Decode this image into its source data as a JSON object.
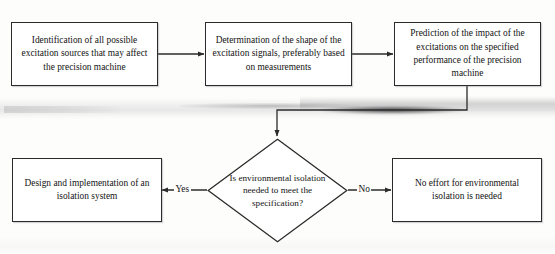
{
  "diagram": {
    "type": "flowchart",
    "nodes": {
      "identification": {
        "shape": "process",
        "text": "Identification of all possible excitation sources that may affect the precision machine"
      },
      "determination": {
        "shape": "process",
        "text": "Determination of the shape of the excitation signals, preferably based on measurements"
      },
      "prediction": {
        "shape": "process",
        "text": "Prediction of the impact of the excitations on the specified performance of the precision machine"
      },
      "decision": {
        "shape": "decision",
        "text": "Is environmental isolation needed to meet the specification?"
      },
      "design": {
        "shape": "process",
        "text": "Design and implementation of an isolation system"
      },
      "no_effort": {
        "shape": "process",
        "text": "No effort for environmental isolation is needed"
      }
    },
    "edge_labels": {
      "yes": "Yes",
      "no": "No"
    },
    "colors": {
      "stroke": "#2b2b2b",
      "text": "#141414",
      "background": "#fdfdfc"
    }
  }
}
